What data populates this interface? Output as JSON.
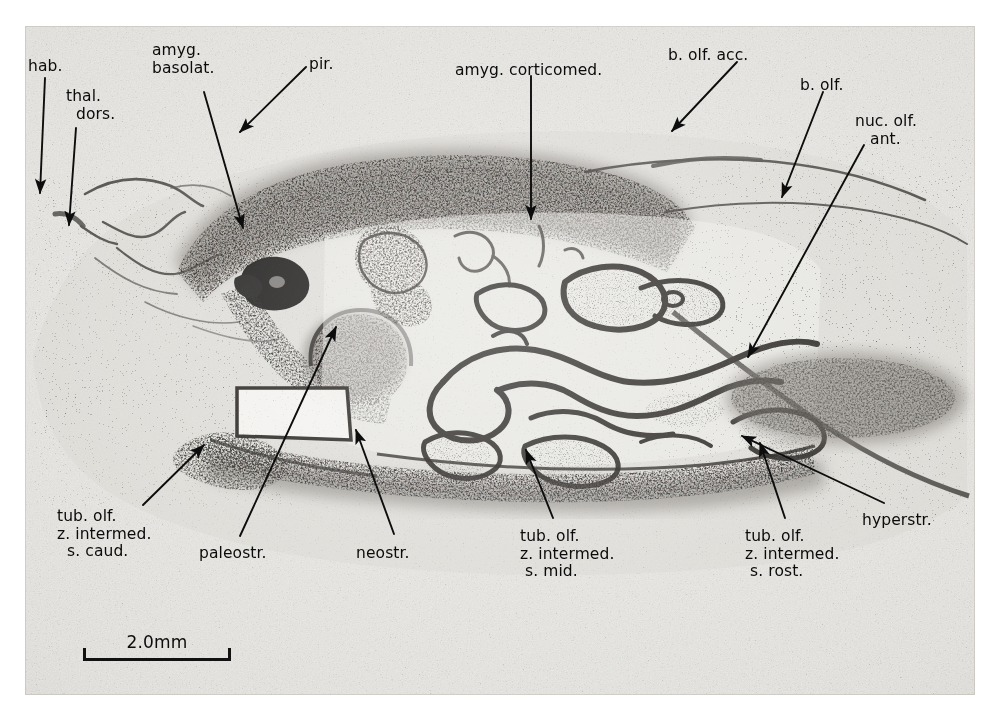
{
  "figure": {
    "kind": "histological-section-photomicrograph",
    "plate": {
      "x": 25,
      "y": 26,
      "width": 950,
      "height": 669,
      "background_color": "#e9e8e4",
      "ink_color": "#2b2a28"
    },
    "label_color": "#0b0b0b",
    "leader_color": "#0d0d0d"
  },
  "scale_bar": {
    "label": "2.0mm",
    "x": 83,
    "y": 632,
    "length_px": 148
  },
  "labels": [
    {
      "id": "hab",
      "lines": [
        "hab."
      ],
      "x": 28,
      "y": 58,
      "align": "left"
    },
    {
      "id": "thal-dors",
      "lines": [
        "thal.",
        "  dors."
      ],
      "x": 66,
      "y": 88,
      "align": "left"
    },
    {
      "id": "amyg-basolat",
      "lines": [
        "amyg.",
        "basolat."
      ],
      "x": 152,
      "y": 42,
      "align": "left"
    },
    {
      "id": "pir",
      "lines": [
        "pir."
      ],
      "x": 309,
      "y": 56,
      "align": "left"
    },
    {
      "id": "amyg-corticomed",
      "lines": [
        "amyg. corticomed."
      ],
      "x": 455,
      "y": 62,
      "align": "left"
    },
    {
      "id": "b-olf-acc",
      "lines": [
        "b. olf. acc."
      ],
      "x": 668,
      "y": 47,
      "align": "left"
    },
    {
      "id": "b-olf",
      "lines": [
        "b. olf."
      ],
      "x": 800,
      "y": 77,
      "align": "left"
    },
    {
      "id": "nuc-olf-ant",
      "lines": [
        "nuc. olf.",
        "   ant."
      ],
      "x": 855,
      "y": 113,
      "align": "left"
    },
    {
      "id": "tub-olf-s-caud",
      "lines": [
        "tub. olf.",
        "z. intermed.",
        "  s. caud."
      ],
      "x": 57,
      "y": 508,
      "align": "left"
    },
    {
      "id": "paleostr",
      "lines": [
        "paleostr."
      ],
      "x": 199,
      "y": 545,
      "align": "left"
    },
    {
      "id": "neostr",
      "lines": [
        "neostr."
      ],
      "x": 356,
      "y": 545,
      "align": "left"
    },
    {
      "id": "tub-olf-s-mid",
      "lines": [
        "tub. olf.",
        "z. intermed.",
        " s. mid."
      ],
      "x": 520,
      "y": 528,
      "align": "left"
    },
    {
      "id": "tub-olf-s-rost",
      "lines": [
        "tub. olf.",
        "z. intermed.",
        " s. rost."
      ],
      "x": 745,
      "y": 528,
      "align": "left"
    },
    {
      "id": "hyperstr",
      "lines": [
        "hyperstr."
      ],
      "x": 862,
      "y": 512,
      "align": "left"
    }
  ],
  "leaders": [
    {
      "id": "hab",
      "points": [
        [
          45,
          78
        ],
        [
          40,
          193
        ]
      ],
      "arrow": true
    },
    {
      "id": "thal-dors",
      "points": [
        [
          76,
          128
        ],
        [
          69,
          225
        ]
      ],
      "arrow": true
    },
    {
      "id": "amyg-basolat",
      "points": [
        [
          204,
          92
        ],
        [
          243,
          228
        ]
      ],
      "arrow": true
    },
    {
      "id": "pir",
      "points": [
        [
          306,
          67
        ],
        [
          240,
          132
        ]
      ],
      "arrow": true
    },
    {
      "id": "amyg-corticomed",
      "points": [
        [
          531,
          76
        ],
        [
          531,
          219
        ]
      ],
      "arrow": true
    },
    {
      "id": "b-olf-acc",
      "points": [
        [
          737,
          62
        ],
        [
          672,
          131
        ]
      ],
      "arrow": true
    },
    {
      "id": "b-olf",
      "points": [
        [
          823,
          92
        ],
        [
          782,
          197
        ]
      ],
      "arrow": true
    },
    {
      "id": "nuc-olf-ant",
      "points": [
        [
          864,
          145
        ],
        [
          748,
          357
        ]
      ],
      "arrow": true
    },
    {
      "id": "tub-olf-s-caud",
      "points": [
        [
          143,
          505
        ],
        [
          204,
          445
        ]
      ],
      "arrow": true
    },
    {
      "id": "paleostr",
      "points": [
        [
          240,
          536
        ],
        [
          336,
          327
        ]
      ],
      "arrow": true
    },
    {
      "id": "neostr",
      "points": [
        [
          394,
          534
        ],
        [
          356,
          430
        ]
      ],
      "arrow": true
    },
    {
      "id": "tub-olf-s-mid",
      "points": [
        [
          553,
          518
        ],
        [
          526,
          450
        ]
      ],
      "arrow": true
    },
    {
      "id": "tub-olf-s-rost",
      "points": [
        [
          785,
          518
        ],
        [
          760,
          443
        ]
      ],
      "arrow": true
    },
    {
      "id": "hyperstr",
      "points": [
        [
          884,
          503
        ],
        [
          742,
          436
        ]
      ],
      "arrow": true
    }
  ]
}
